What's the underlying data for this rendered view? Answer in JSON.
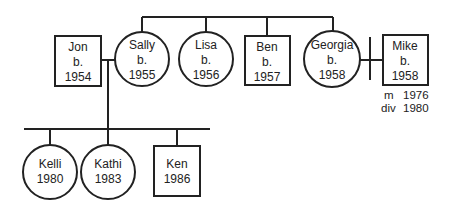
{
  "diagram": {
    "type": "genogram",
    "colors": {
      "stroke": "#222222",
      "background": "#ffffff"
    },
    "parents_generation": [
      {
        "id": "jon",
        "name": "Jon",
        "sex": "male",
        "shape": "square",
        "line2": "b.",
        "line3": "1954"
      },
      {
        "id": "sally",
        "name": "Sally",
        "sex": "female",
        "shape": "circle",
        "line2": "b.",
        "line3": "1955"
      },
      {
        "id": "lisa",
        "name": "Lisa",
        "sex": "female",
        "shape": "circle",
        "line2": "b.",
        "line3": "1956"
      },
      {
        "id": "ben",
        "name": "Ben",
        "sex": "male",
        "shape": "square",
        "line2": "b.",
        "line3": "1957"
      },
      {
        "id": "georgia",
        "name": "Georgia",
        "sex": "female",
        "shape": "circle",
        "line2": "b.",
        "line3": "1958"
      },
      {
        "id": "mike",
        "name": "Mike",
        "sex": "male",
        "shape": "square",
        "line2": "b.",
        "line3": "1958"
      }
    ],
    "children_generation": [
      {
        "id": "kelli",
        "name": "Kelli",
        "sex": "female",
        "shape": "circle",
        "year": "1980"
      },
      {
        "id": "kathi",
        "name": "Kathi",
        "sex": "female",
        "shape": "circle",
        "year": "1983"
      },
      {
        "id": "ken",
        "name": "Ken",
        "sex": "male",
        "shape": "square",
        "year": "1986"
      }
    ],
    "relationships": [
      {
        "type": "marriage",
        "between": [
          "jon",
          "sally"
        ]
      },
      {
        "type": "divorced-marriage",
        "between": [
          "georgia",
          "mike"
        ],
        "married_label": "m",
        "married_year": "1976",
        "divorced_label": "div",
        "divorced_year": "1980"
      }
    ],
    "sibling_group": [
      "sally",
      "lisa",
      "ben",
      "georgia"
    ],
    "children_of": [
      "jon",
      "sally"
    ]
  }
}
